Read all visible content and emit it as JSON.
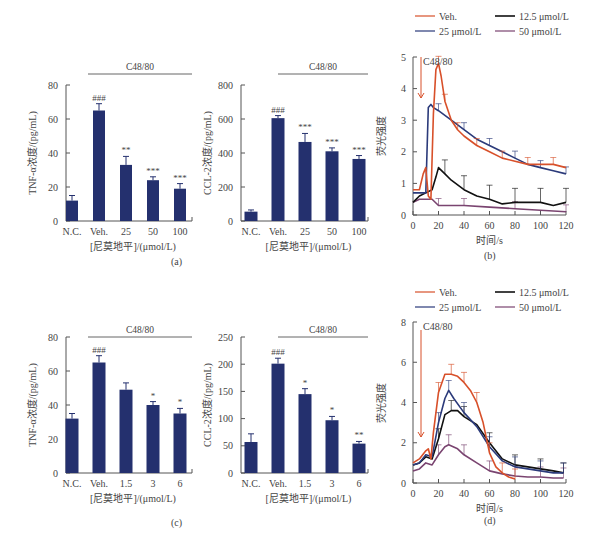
{
  "panels": {
    "a": {
      "label": "(a)"
    },
    "b": {
      "label": "(b)"
    },
    "c": {
      "label": "(c)"
    },
    "d": {
      "label": "(d)"
    }
  },
  "colors": {
    "bar": "#24306e",
    "veh": "#d8502a",
    "c12_5": "#111111",
    "c25": "#2b3a7a",
    "c50": "#7a4470",
    "axis": "#555555"
  },
  "chart_data": [
    {
      "id": "a-left",
      "type": "bar",
      "title": "",
      "bracket_label": "C48/80",
      "ylabel": "TNF-α浓度/(pg/mL)",
      "xlabel": "[尼莫地平]/(μmol/L)",
      "ylim": [
        0,
        80
      ],
      "yticks": [
        0,
        20,
        40,
        60,
        80
      ],
      "categories": [
        "N.C.",
        "Veh.",
        "25",
        "50",
        "100"
      ],
      "values": [
        12,
        65,
        33,
        24,
        19
      ],
      "errors": [
        3,
        4,
        5,
        2,
        3
      ],
      "significance": [
        "",
        "###",
        "**",
        "***",
        "***"
      ]
    },
    {
      "id": "a-right",
      "type": "bar",
      "bracket_label": "C48/80",
      "ylabel": "CCL-2浓度/(pg/mL)",
      "xlabel": "[尼莫地平]/(μmol/L)",
      "ylim": [
        0,
        800
      ],
      "yticks": [
        0,
        200,
        400,
        600,
        800
      ],
      "categories": [
        "N.C.",
        "Veh.",
        "25",
        "50",
        "100"
      ],
      "values": [
        55,
        605,
        465,
        410,
        365
      ],
      "errors": [
        10,
        15,
        50,
        20,
        20
      ],
      "significance": [
        "",
        "###",
        "***",
        "***",
        "***"
      ]
    },
    {
      "id": "b",
      "type": "line",
      "annotation": "C48/80",
      "ylabel": "荧光强度",
      "xlabel": "时间/s",
      "xlim": [
        0,
        120
      ],
      "ylim": [
        0,
        5
      ],
      "xticks": [
        0,
        20,
        40,
        60,
        80,
        100,
        120
      ],
      "yticks": [
        0,
        1,
        2,
        3,
        4,
        5
      ],
      "legend": [
        "Veh.",
        "12.5 μmol/L",
        "25 μmol/L",
        "50 μmol/L"
      ],
      "series": [
        {
          "name": "Veh.",
          "x": [
            0,
            5,
            8,
            10,
            12,
            14,
            16,
            18,
            20,
            22,
            25,
            30,
            35,
            40,
            50,
            60,
            70,
            80,
            90,
            100,
            110,
            120
          ],
          "y": [
            0.8,
            0.8,
            1.3,
            1.5,
            0.6,
            0.5,
            3.2,
            4.6,
            4.8,
            4.4,
            3.6,
            3.0,
            2.7,
            2.5,
            2.2,
            2.0,
            1.8,
            1.7,
            1.6,
            1.6,
            1.6,
            1.5
          ]
        },
        {
          "name": "12.5 μmol/L",
          "x": [
            0,
            5,
            10,
            15,
            18,
            20,
            25,
            30,
            40,
            50,
            60,
            70,
            80,
            90,
            100,
            110,
            120
          ],
          "y": [
            0.4,
            0.6,
            0.7,
            0.8,
            1.2,
            1.5,
            1.3,
            1.1,
            0.8,
            0.6,
            0.5,
            0.35,
            0.4,
            0.4,
            0.4,
            0.3,
            0.4
          ]
        },
        {
          "name": "25 μmol/L",
          "x": [
            0,
            5,
            10,
            12,
            14,
            16,
            20,
            30,
            40,
            50,
            60,
            70,
            80,
            90,
            100,
            110,
            120
          ],
          "y": [
            0.7,
            0.7,
            0.7,
            3.4,
            3.5,
            3.4,
            3.3,
            3.0,
            2.7,
            2.4,
            2.2,
            2.0,
            1.8,
            1.6,
            1.5,
            1.4,
            1.3
          ]
        },
        {
          "name": "50 μmol/L",
          "x": [
            0,
            5,
            10,
            15,
            20,
            30,
            40,
            60,
            80,
            100,
            120
          ],
          "y": [
            0.4,
            0.5,
            0.5,
            0.5,
            0.3,
            0.3,
            0.3,
            0.25,
            0.2,
            0.15,
            0.1
          ]
        }
      ]
    },
    {
      "id": "c-left",
      "type": "bar",
      "bracket_label": "C48/80",
      "ylabel": "TNF-α浓度/(pg/mL)",
      "xlabel": "[尼莫地平]/(μmol/L)",
      "ylim": [
        0,
        80
      ],
      "yticks": [
        0,
        20,
        40,
        60,
        80
      ],
      "categories": [
        "N.C.",
        "Veh.",
        "1.5",
        "3",
        "6"
      ],
      "values": [
        32,
        65,
        49,
        40,
        35
      ],
      "errors": [
        3,
        4,
        4,
        2,
        3
      ],
      "significance": [
        "",
        "###",
        "",
        "*",
        "*"
      ]
    },
    {
      "id": "c-right",
      "type": "bar",
      "bracket_label": "C48/80",
      "ylabel": "CCL-2浓度/(pg/mL)",
      "xlabel": "[尼莫地平]/(μmol/L)",
      "ylim": [
        0,
        250
      ],
      "yticks": [
        0,
        50,
        100,
        150,
        200,
        250
      ],
      "categories": [
        "N.C.",
        "Veh.",
        "1.5",
        "3",
        "6"
      ],
      "values": [
        57,
        201,
        145,
        97,
        54
      ],
      "errors": [
        15,
        10,
        10,
        7,
        4
      ],
      "significance": [
        "",
        "###",
        "*",
        "*",
        "**"
      ]
    },
    {
      "id": "d",
      "type": "line",
      "annotation": "C48/80",
      "ylabel": "荧光强度",
      "xlabel": "时间/s",
      "xlim": [
        0,
        120
      ],
      "ylim": [
        0,
        8
      ],
      "xticks": [
        0,
        20,
        40,
        60,
        80,
        100,
        120
      ],
      "yticks": [
        0,
        2,
        4,
        6,
        8
      ],
      "legend": [
        "Veh.",
        "12.5 μmol/L",
        "25 μmol/L",
        "50 μmol/L"
      ],
      "series": [
        {
          "name": "Veh.",
          "x": [
            0,
            5,
            10,
            12,
            14,
            16,
            20,
            25,
            30,
            35,
            40,
            45,
            50,
            55,
            60,
            65,
            70,
            75,
            80
          ],
          "y": [
            1.0,
            1.2,
            1.6,
            1.7,
            1.2,
            2.5,
            4.5,
            5.4,
            5.4,
            5.3,
            5.0,
            4.6,
            4.0,
            3.0,
            1.5,
            0.8,
            0.5,
            0.3,
            0.2
          ]
        },
        {
          "name": "12.5 μmol/L",
          "x": [
            0,
            5,
            10,
            15,
            20,
            25,
            30,
            35,
            40,
            50,
            60,
            70,
            80,
            90,
            100,
            110,
            118
          ],
          "y": [
            0.9,
            1.0,
            1.3,
            1.2,
            2.2,
            3.4,
            3.6,
            3.6,
            3.3,
            2.9,
            2.0,
            1.2,
            0.9,
            0.8,
            0.7,
            0.6,
            0.5
          ]
        },
        {
          "name": "25 μmol/L",
          "x": [
            0,
            5,
            10,
            15,
            20,
            25,
            28,
            32,
            40,
            50,
            60,
            70,
            80,
            90,
            100,
            110,
            118
          ],
          "y": [
            0.9,
            1.0,
            1.4,
            1.3,
            3.0,
            4.2,
            4.6,
            4.2,
            3.5,
            2.8,
            1.8,
            1.1,
            0.8,
            0.7,
            0.6,
            0.5,
            0.5
          ]
        },
        {
          "name": "50 μmol/L",
          "x": [
            0,
            5,
            10,
            15,
            20,
            25,
            28,
            35,
            40,
            50,
            60,
            70,
            80,
            90,
            100,
            110,
            118
          ],
          "y": [
            0.6,
            0.7,
            1.0,
            0.9,
            1.4,
            1.8,
            1.9,
            1.7,
            1.4,
            1.0,
            0.6,
            0.45,
            0.35,
            0.3,
            0.3,
            0.25,
            0.25
          ]
        }
      ]
    }
  ]
}
